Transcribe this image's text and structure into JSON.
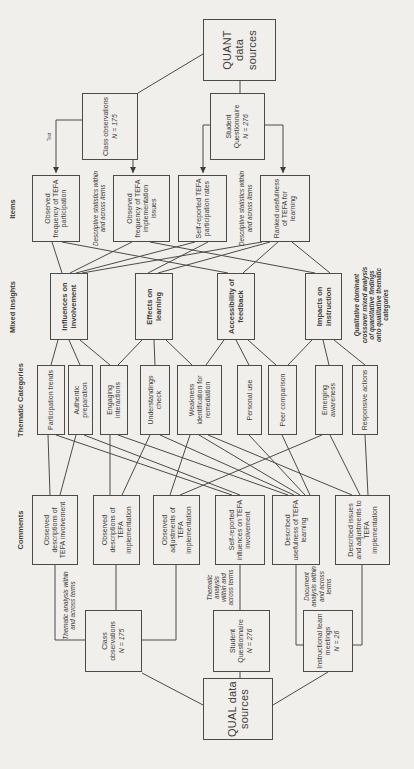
{
  "quant": {
    "label": "QUANT data sources"
  },
  "quant_sources": [
    {
      "label": "Class observations",
      "n": "N = 175"
    },
    {
      "label": "Student Questionnaire",
      "n": "N = 276"
    }
  ],
  "headers": {
    "items": "Items",
    "mixed_insights": "Mixed Insights",
    "thematic_categories": "Thematic Categories",
    "comments": "Comments"
  },
  "items": [
    "Observed frequency of TEFA participation",
    "Observed frequency of TEFA implementation issues",
    "Self-reported TEFA participation rates",
    "Ranked usefulness of TEFA for learning"
  ],
  "items_annotations": [
    "Descriptive statistics within and across items",
    "Descriptive statistics within and across items"
  ],
  "insights": [
    "Influences on involvement",
    "Effects on learning",
    "Accessibility of feedback",
    "Impacts on instruction"
  ],
  "insights_annotation": "Qualitative dominant crossover mixed analysis of quantitative findings onto qualitative thematic categories",
  "categories": [
    "Participation trends",
    "Authentic preparation",
    "Engaging interactions",
    "Understandings check",
    "Weakness identification for remediation",
    "Personal use",
    "Peer comparison",
    "Emerging awareness",
    "Responsive actions"
  ],
  "comments": [
    "Observed descriptions of TEFA involvement",
    "Observed descriptions of TEFA implementation",
    "Observed adjustments of TEFA implementation",
    "Self-reported influences on TEFA involvement",
    "Described usefulness of TEFA learning",
    "Described issues and adjustments to TEFA implementation"
  ],
  "qual_sources": [
    {
      "label": "Class observations",
      "n": "N = 175",
      "annotation": "Thematic analysis within and across terms"
    },
    {
      "label": "Student Questionnaire",
      "n": "N = 276",
      "annotation": "Thematic analysis within and across terms"
    },
    {
      "label": "Instructional team meetings",
      "n": "N = 26",
      "annotation": "Document analysis within and across terms"
    }
  ],
  "qual": {
    "label": "QUAL data sources"
  },
  "tiny_label": "Text"
}
